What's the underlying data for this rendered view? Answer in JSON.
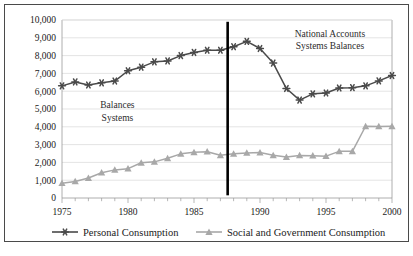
{
  "chart_data": {
    "type": "line",
    "title": "",
    "xlabel": "",
    "ylabel": "",
    "x": [
      1975,
      1976,
      1977,
      1978,
      1979,
      1980,
      1981,
      1982,
      1983,
      1984,
      1985,
      1986,
      1987,
      1988,
      1989,
      1990,
      1991,
      1992,
      1993,
      1994,
      1995,
      1996,
      1997,
      1998,
      1999,
      2000
    ],
    "xlim": [
      1975,
      2000
    ],
    "ylim": [
      0,
      10000
    ],
    "ytick_values": [
      0,
      1000,
      2000,
      3000,
      4000,
      5000,
      6000,
      7000,
      8000,
      9000,
      10000
    ],
    "ytick_labels": [
      "0",
      "1,000",
      "2,000",
      "3,000",
      "4,000",
      "5,000",
      "6,000",
      "7,000",
      "8,000",
      "9,000",
      "10,000"
    ],
    "xtick_values": [
      1975,
      1980,
      1985,
      1990,
      1995,
      2000
    ],
    "xtick_labels": [
      "1975",
      "1980",
      "1985",
      "1990",
      "1995",
      "2000"
    ],
    "xtick_minor_step": 1,
    "grid": true,
    "grid_axis": "y",
    "legend_position": "bottom",
    "series": [
      {
        "name": "Personal Consumption",
        "color": "#4a4a4a",
        "marker": "asterisk",
        "values": [
          6300,
          6520,
          6350,
          6470,
          6570,
          7150,
          7350,
          7650,
          7700,
          8000,
          8180,
          8300,
          8300,
          8500,
          8800,
          8400,
          7580,
          6150,
          5500,
          5850,
          5900,
          6180,
          6200,
          6300,
          6580,
          6880
        ]
      },
      {
        "name": "Social and Government Consumption",
        "color": "#a8a8a8",
        "marker": "triangle",
        "values": [
          830,
          930,
          1120,
          1420,
          1580,
          1650,
          1980,
          2030,
          2230,
          2480,
          2570,
          2600,
          2400,
          2480,
          2530,
          2550,
          2400,
          2300,
          2390,
          2380,
          2350,
          2620,
          2620,
          4030,
          4020,
          4030
        ]
      }
    ],
    "annotations": [
      {
        "name": "left-annotation",
        "lines": [
          "Balances",
          "Systems"
        ],
        "x": 1979.2,
        "y": 5050
      },
      {
        "name": "right-annotation",
        "lines": [
          "National Accounts",
          "Systems Balances"
        ],
        "x": 1995.3,
        "y": 9050
      }
    ],
    "divider": {
      "name": "period-divider",
      "x": 1987.55,
      "y_top": 9900,
      "y_bottom": 150,
      "color": "#000000"
    }
  }
}
